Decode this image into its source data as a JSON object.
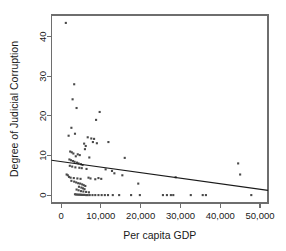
{
  "chart_data": {
    "type": "scatter",
    "title": "",
    "xlabel": "Per capita GDP",
    "ylabel": "Degree of Judicial Corruption",
    "xlim": [
      -2400,
      52000
    ],
    "ylim": [
      -2.0,
      45.5
    ],
    "xticks": [
      0,
      10000,
      20000,
      30000,
      40000,
      50000
    ],
    "xticklabels": [
      "0",
      "10,000",
      "20,000",
      "30,000",
      "40,000",
      "50,000"
    ],
    "yticks": [
      0,
      10,
      20,
      30,
      40
    ],
    "yticklabels": [
      "0",
      "10",
      "20",
      "30",
      "40"
    ],
    "grid": false,
    "legend": null,
    "point_color": "#4a4a4a",
    "line_color": "#1a1a1a",
    "frame_color": "#6e6e6e",
    "trendline": {
      "type": "linear-fit",
      "x_start": -2400,
      "y_start": 8.8,
      "x_end": 52000,
      "y_end": 1.2
    },
    "points": [
      [
        1200,
        43.5
      ],
      [
        3300,
        28.0
      ],
      [
        2900,
        24.2
      ],
      [
        3900,
        22.0
      ],
      [
        9700,
        21.0
      ],
      [
        8800,
        19.0
      ],
      [
        2600,
        17.0
      ],
      [
        3500,
        15.5
      ],
      [
        1900,
        15.0
      ],
      [
        6700,
        14.6
      ],
      [
        7600,
        14.3
      ],
      [
        8300,
        14.2
      ],
      [
        8000,
        13.4
      ],
      [
        9000,
        13.1
      ],
      [
        5800,
        13.0
      ],
      [
        6200,
        12.4
      ],
      [
        11900,
        13.4
      ],
      [
        6000,
        11.6
      ],
      [
        2300,
        11.0
      ],
      [
        2700,
        10.8
      ],
      [
        3100,
        10.5
      ],
      [
        4200,
        10.3
      ],
      [
        4700,
        10.1
      ],
      [
        3700,
        9.8
      ],
      [
        7100,
        9.5
      ],
      [
        16000,
        9.4
      ],
      [
        2100,
        9.0
      ],
      [
        2500,
        8.8
      ],
      [
        3000,
        8.6
      ],
      [
        3400,
        8.4
      ],
      [
        4000,
        8.2
      ],
      [
        4400,
        8.0
      ],
      [
        5000,
        7.8
      ],
      [
        5400,
        7.6
      ],
      [
        2200,
        7.4
      ],
      [
        2800,
        7.2
      ],
      [
        3600,
        7.0
      ],
      [
        4600,
        6.9
      ],
      [
        5200,
        6.8
      ],
      [
        6400,
        6.6
      ],
      [
        11200,
        6.5
      ],
      [
        12800,
        6.1
      ],
      [
        1400,
        5.2
      ],
      [
        1700,
        5.0
      ],
      [
        13400,
        5.5
      ],
      [
        15400,
        5.0
      ],
      [
        45000,
        5.2
      ],
      [
        44500,
        8.0
      ],
      [
        2000,
        4.6
      ],
      [
        2400,
        4.4
      ],
      [
        3200,
        4.3
      ],
      [
        4100,
        4.2
      ],
      [
        4900,
        4.1
      ],
      [
        6900,
        4.4
      ],
      [
        7400,
        4.2
      ],
      [
        8600,
        4.0
      ],
      [
        9400,
        4.3
      ],
      [
        10100,
        4.1
      ],
      [
        19400,
        2.9
      ],
      [
        28800,
        4.5
      ],
      [
        2600,
        3.6
      ],
      [
        3300,
        3.4
      ],
      [
        3800,
        3.2
      ],
      [
        4300,
        3.0
      ],
      [
        4800,
        2.9
      ],
      [
        5300,
        2.7
      ],
      [
        5700,
        2.5
      ],
      [
        6100,
        2.3
      ],
      [
        4500,
        2.1
      ],
      [
        5100,
        1.9
      ],
      [
        5500,
        1.7
      ],
      [
        5900,
        1.5
      ],
      [
        3900,
        1.4
      ],
      [
        4400,
        1.2
      ],
      [
        5000,
        1.0
      ],
      [
        5600,
        0.9
      ],
      [
        6300,
        0.8
      ],
      [
        7000,
        0.7
      ],
      [
        3500,
        0.2
      ],
      [
        3800,
        0.15
      ],
      [
        4100,
        0.12
      ],
      [
        4400,
        0.1
      ],
      [
        4700,
        0.1
      ],
      [
        5000,
        0.08
      ],
      [
        5300,
        0.05
      ],
      [
        5600,
        0.05
      ],
      [
        5900,
        0.05
      ],
      [
        6300,
        0.0
      ],
      [
        6700,
        0.0
      ],
      [
        7200,
        0.0
      ],
      [
        7900,
        0.0
      ],
      [
        8600,
        0.0
      ],
      [
        9400,
        0.0
      ],
      [
        10200,
        0.0
      ],
      [
        11000,
        0.0
      ],
      [
        11800,
        0.0
      ],
      [
        13000,
        0.0
      ],
      [
        14600,
        0.0
      ],
      [
        17600,
        0.0
      ],
      [
        19800,
        0.0
      ],
      [
        25600,
        0.0
      ],
      [
        26600,
        0.0
      ],
      [
        27600,
        0.0
      ],
      [
        28200,
        0.0
      ],
      [
        32600,
        0.0
      ],
      [
        35600,
        0.0
      ],
      [
        36400,
        0.0
      ],
      [
        47800,
        0.0
      ]
    ]
  }
}
